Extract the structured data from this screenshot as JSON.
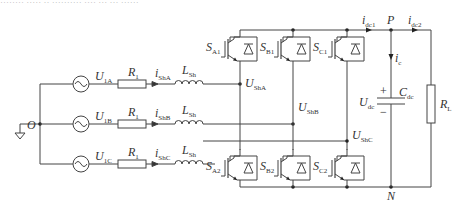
{
  "top_text": "········ ····· ·· ··········   ···· ··· ··· ······",
  "node_labels": {
    "O": "O",
    "P": "P",
    "N": "N"
  },
  "sources": [
    {
      "main": "U",
      "sub": "1A"
    },
    {
      "main": "U",
      "sub": "1B"
    },
    {
      "main": "U",
      "sub": "1C"
    }
  ],
  "resistors": [
    {
      "main": "R",
      "sub": "1"
    },
    {
      "main": "R",
      "sub": "1"
    },
    {
      "main": "R",
      "sub": "1"
    }
  ],
  "currents": [
    {
      "main": "i",
      "sub": "ShA"
    },
    {
      "main": "i",
      "sub": "ShB"
    },
    {
      "main": "i",
      "sub": "ShC"
    }
  ],
  "inductors": [
    {
      "main": "L",
      "sub": "Sh"
    },
    {
      "main": "L",
      "sub": "Sh"
    },
    {
      "main": "L",
      "sub": "Sh"
    }
  ],
  "phase_voltages": [
    {
      "main": "U",
      "sub": "ShA"
    },
    {
      "main": "U",
      "sub": "ShB"
    },
    {
      "main": "U",
      "sub": "ShC"
    }
  ],
  "switches_upper": [
    {
      "main": "S",
      "sub": "A1"
    },
    {
      "main": "S",
      "sub": "B1"
    },
    {
      "main": "S",
      "sub": "C1"
    }
  ],
  "switches_lower": [
    {
      "main": "S",
      "sub": "A2"
    },
    {
      "main": "S",
      "sub": "B2"
    },
    {
      "main": "S",
      "sub": "C2"
    }
  ],
  "dc_side": {
    "idc1": {
      "main": "i",
      "sub": "dc1"
    },
    "idc2": {
      "main": "i",
      "sub": "dc2"
    },
    "ic": {
      "main": "i",
      "sub": "c"
    },
    "udc": {
      "main": "U",
      "sub": "dc"
    },
    "cdc": {
      "main": "C",
      "sub": "dc"
    },
    "rl": {
      "main": "R",
      "sub": "L"
    },
    "plus": "+",
    "minus": "−"
  }
}
